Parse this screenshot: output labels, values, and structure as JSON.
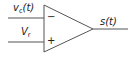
{
  "diagram": {
    "type": "comparator",
    "inputs": {
      "inverting": {
        "sign": "−",
        "label_main": "v",
        "label_sub": "c",
        "label_arg": "(t)"
      },
      "non_inverting": {
        "sign": "+",
        "label_main": "V",
        "label_sub": "r"
      }
    },
    "output": {
      "label": "s(t)"
    },
    "colors": {
      "stroke": "#555555",
      "text": "#222222",
      "background": "#ffffff"
    }
  }
}
